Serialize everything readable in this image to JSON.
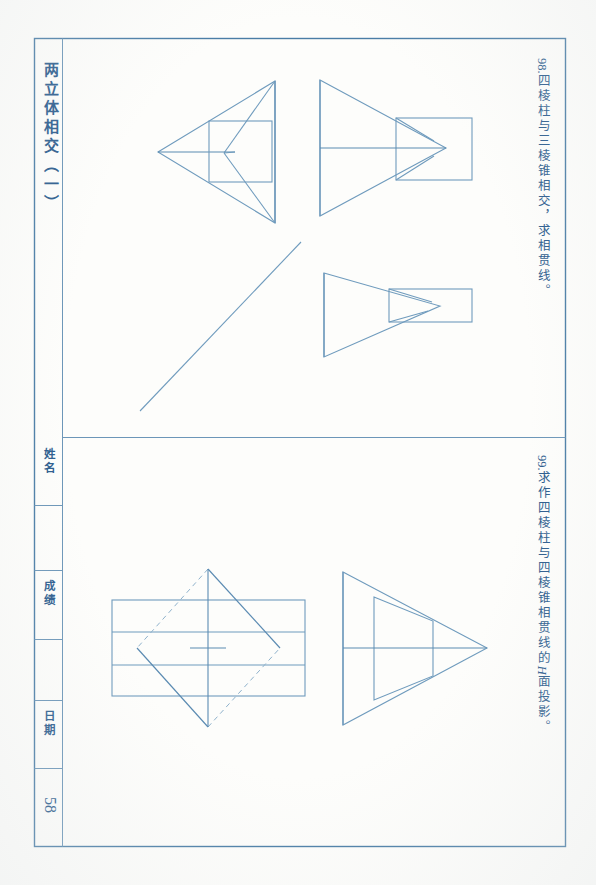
{
  "page": {
    "title": "两立体相交（一）",
    "page_number": "58",
    "ink_color": "#5a87ab",
    "text_color": "#2c5c8d",
    "background_color": "#fdfdfb"
  },
  "problems": [
    {
      "id": "problem-98",
      "number": "98.",
      "text": "四棱柱与三棱锥相交，求相贯线。",
      "full": "98. 四棱柱与三棱锥相交，求相贯线。"
    },
    {
      "id": "problem-99",
      "number": "99.",
      "text_before": "求作四棱柱与四棱锥相贯线的",
      "italic": "H",
      "text_after": "面投影。",
      "full": "99. 求作四棱柱与四棱锥相贯线的 H 面投影。"
    }
  ],
  "title_block": {
    "cells": [
      {
        "label": "姓名",
        "value": ""
      },
      {
        "label": "成绩",
        "value": ""
      },
      {
        "label": "日期",
        "value": ""
      }
    ],
    "page_number": "58"
  },
  "figures": [
    {
      "name": "figure-98-top-view",
      "description": "三棱锥俯视图与四棱柱投影相交",
      "shapes": [
        "triangle-pointing-left",
        "rectangle-overlap",
        "center-axis"
      ]
    },
    {
      "name": "figure-98-front-view",
      "description": "三棱锥正面投影与四棱柱相交",
      "shapes": [
        "triangle-pointing-right",
        "rectangle-overlap",
        "center-axis"
      ]
    },
    {
      "name": "figure-98-side-view",
      "description": "侧面投影",
      "shapes": [
        "triangle-pointing-right",
        "rectangle-overlap"
      ]
    },
    {
      "name": "figure-98-45-line",
      "description": "45度辅助线",
      "shapes": [
        "diagonal-line"
      ]
    },
    {
      "name": "figure-99-top-view",
      "description": "四棱锥俯视图菱形与四棱柱矩形相交",
      "shapes": [
        "diamond",
        "rectangle-with-divisions",
        "center-cross",
        "hidden-dashed-edges"
      ]
    },
    {
      "name": "figure-99-side-view",
      "description": "四棱锥与四棱柱侧面投影",
      "shapes": [
        "large-triangle-pointing-right",
        "inner-trapezoid",
        "center-axis"
      ]
    }
  ]
}
